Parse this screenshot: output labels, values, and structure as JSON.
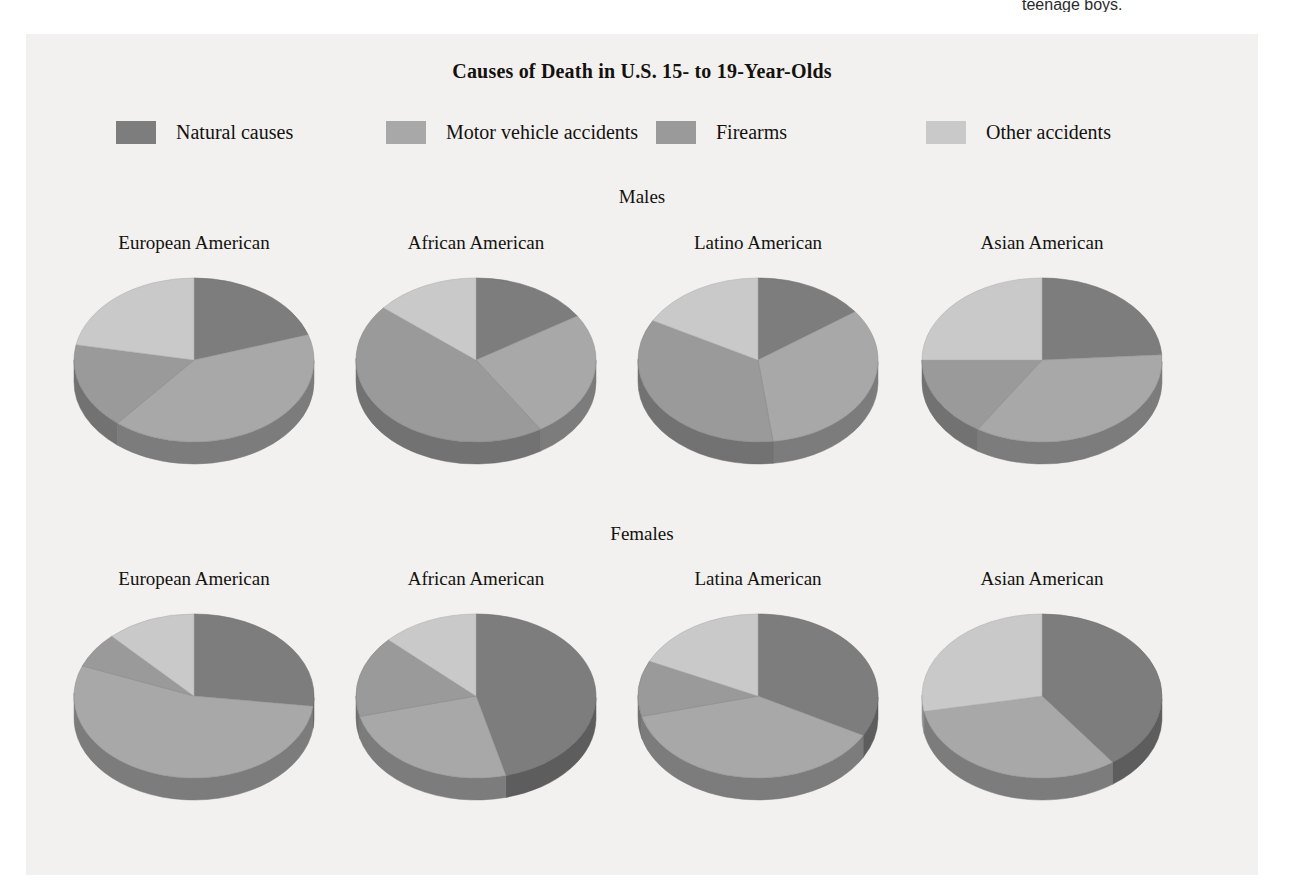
{
  "cropped_caption": "teenage boys.",
  "chart_data": {
    "type": "pie",
    "title": "Causes of Death in U.S. 15- to 19-Year-Olds",
    "legend_position": "top",
    "legend": [
      {
        "label": "Natural causes",
        "color": "#7d7d7d"
      },
      {
        "label": "Motor vehicle accidents",
        "color": "#a8a8a8"
      },
      {
        "label": "Firearms",
        "color": "#9a9a9a"
      },
      {
        "label": "Other accidents",
        "color": "#c9c9c9"
      }
    ],
    "categories": [
      "Natural causes",
      "Motor vehicle accidents",
      "Firearms",
      "Other accidents"
    ],
    "sections": [
      {
        "label": "Males",
        "charts": [
          {
            "label": "European American",
            "values": [
              20,
              41,
              17,
              22
            ]
          },
          {
            "label": "African American",
            "values": [
              16,
              25,
              45,
              14
            ]
          },
          {
            "label": "Latino American",
            "values": [
              15,
              33,
              35,
              17
            ]
          },
          {
            "label": "Asian American",
            "values": [
              24,
              35,
              16,
              25
            ]
          }
        ]
      },
      {
        "label": "Females",
        "charts": [
          {
            "label": "European American",
            "values": [
              27,
              54,
              7,
              12
            ]
          },
          {
            "label": "African American",
            "values": [
              46,
              25,
              16,
              13
            ]
          },
          {
            "label": "Latina American",
            "values": [
              33,
              38,
              11,
              18
            ]
          },
          {
            "label": "Asian American",
            "values": [
              40,
              32,
              0,
              28
            ]
          }
        ]
      }
    ]
  }
}
